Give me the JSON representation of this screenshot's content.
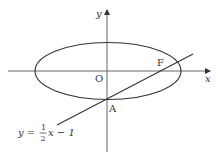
{
  "diagram": {
    "type": "coordinate-plane",
    "axes": {
      "x_label": "x",
      "y_label": "y",
      "origin_label": "O"
    },
    "ellipse": {
      "center": [
        0,
        0
      ],
      "description": "ellipse centered at origin, horizontal major axis"
    },
    "line": {
      "equation": "y = 1/2 x − 1",
      "prefix": "y =",
      "numerator": "1",
      "denominator": "2",
      "suffix": "x − 1"
    },
    "points": [
      {
        "label": "F",
        "description": "right focus of ellipse on x-axis, on the line"
      },
      {
        "label": "A",
        "description": "lower vertex of ellipse on y-axis, on the line"
      }
    ],
    "colors": {
      "stroke": "#333333",
      "background": "#ffffff"
    }
  }
}
